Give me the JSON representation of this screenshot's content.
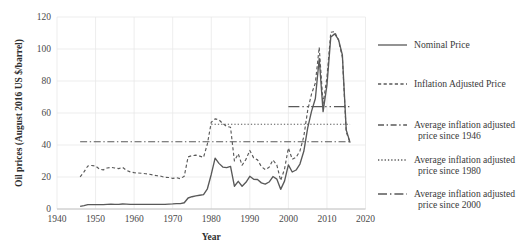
{
  "chart_data": {
    "type": "line",
    "title": "",
    "xlabel": "Year",
    "ylabel": "Oil prices (August 2016 US $/barrel)",
    "xlim": [
      1940,
      2020
    ],
    "ylim": [
      0,
      120
    ],
    "xticks": [
      "1940",
      "1950",
      "1960",
      "1970",
      "1980",
      "1990",
      "2000",
      "2010",
      "2020"
    ],
    "yticks": [
      "0",
      "20",
      "40",
      "60",
      "80",
      "100",
      "120"
    ],
    "grid": true,
    "legend_position": "right",
    "series": [
      {
        "name": "Nominal Price",
        "style": "solid",
        "x": [
          1946,
          1947,
          1948,
          1949,
          1950,
          1951,
          1952,
          1953,
          1954,
          1955,
          1956,
          1957,
          1958,
          1959,
          1960,
          1961,
          1962,
          1963,
          1964,
          1965,
          1966,
          1967,
          1968,
          1969,
          1970,
          1971,
          1972,
          1973,
          1974,
          1975,
          1976,
          1977,
          1978,
          1979,
          1980,
          1981,
          1982,
          1983,
          1984,
          1985,
          1986,
          1987,
          1988,
          1989,
          1990,
          1991,
          1992,
          1993,
          1994,
          1995,
          1996,
          1997,
          1998,
          1999,
          2000,
          2001,
          2002,
          2003,
          2004,
          2005,
          2006,
          2007,
          2008,
          2009,
          2010,
          2011,
          2012,
          2013,
          2014,
          2015,
          2016
        ],
        "values": [
          1.63,
          2.16,
          2.77,
          2.77,
          2.77,
          2.77,
          2.77,
          2.92,
          2.99,
          2.93,
          2.94,
          3.14,
          3.0,
          2.9,
          2.88,
          2.89,
          2.9,
          2.89,
          2.88,
          2.86,
          2.88,
          2.92,
          2.94,
          3.09,
          3.18,
          3.39,
          3.39,
          3.89,
          6.87,
          7.67,
          8.19,
          8.57,
          9.0,
          12.64,
          21.59,
          31.77,
          28.52,
          26.19,
          25.88,
          26.67,
          14.24,
          17.31,
          14.24,
          16.71,
          20.45,
          18.62,
          18.44,
          16.33,
          15.53,
          16.86,
          20.29,
          18.68,
          12.28,
          17.44,
          27.6,
          23.12,
          24.36,
          28.1,
          36.05,
          50.59,
          61.0,
          69.04,
          94.1,
          60.86,
          77.38,
          107.46,
          109.45,
          105.87,
          96.29,
          49.49,
          41.5
        ]
      },
      {
        "name": "Inflation Adjusted Price",
        "style": "dashed",
        "x": [
          1946,
          1947,
          1948,
          1949,
          1950,
          1951,
          1952,
          1953,
          1954,
          1955,
          1956,
          1957,
          1958,
          1959,
          1960,
          1961,
          1962,
          1963,
          1964,
          1965,
          1966,
          1967,
          1968,
          1969,
          1970,
          1971,
          1972,
          1973,
          1974,
          1975,
          1976,
          1977,
          1978,
          1979,
          1980,
          1981,
          1982,
          1983,
          1984,
          1985,
          1986,
          1987,
          1988,
          1989,
          1990,
          1991,
          1992,
          1993,
          1994,
          1995,
          1996,
          1997,
          1998,
          1999,
          2000,
          2001,
          2002,
          2003,
          2004,
          2005,
          2006,
          2007,
          2008,
          2009,
          2010,
          2011,
          2012,
          2013,
          2014,
          2015,
          2016
        ],
        "values": [
          20.05,
          23.2,
          26.9,
          27.2,
          26.85,
          24.95,
          24.45,
          25.6,
          26.05,
          25.6,
          25.25,
          26.05,
          24.2,
          23.2,
          22.7,
          22.5,
          22.35,
          22.05,
          21.7,
          21.2,
          20.8,
          20.45,
          19.75,
          19.7,
          19.15,
          19.55,
          18.95,
          20.5,
          32.6,
          33.35,
          33.65,
          33.05,
          32.3,
          40.7,
          54.2,
          56.35,
          55.75,
          53.35,
          51.65,
          51.1,
          30.05,
          34.5,
          27.35,
          31.05,
          36.6,
          31.95,
          30.7,
          26.5,
          24.6,
          26.05,
          30.65,
          27.55,
          17.8,
          24.9,
          38.15,
          31.1,
          32.25,
          36.3,
          45.3,
          61.55,
          71.85,
          78.8,
          101.05,
          65.65,
          82.15,
          110.45,
          110.85,
          105.45,
          94.85,
          48.15,
          41.55
        ]
      }
    ],
    "reference_lines": [
      {
        "name": "Average inflation adjusted price since 1946",
        "value": 42,
        "x_start": 1946,
        "x_end": 2016,
        "style": "dash-dot"
      },
      {
        "name": "Average inflation adjusted price since 1980",
        "value": 53,
        "x_start": 1980,
        "x_end": 2016,
        "style": "dotted"
      },
      {
        "name": "Average inflation adjusted price since 2000",
        "value": 64,
        "x_start": 2000,
        "x_end": 2016,
        "style": "long-dash-dot-dot"
      }
    ]
  },
  "legend": {
    "items": [
      {
        "label": "Nominal Price",
        "style": "solid"
      },
      {
        "label": "Inflation Adjusted Price",
        "style": "dashed"
      },
      {
        "label_line1": "Average inflation adjusted",
        "label_line2": "price since 1946",
        "style": "dash-dot"
      },
      {
        "label_line1": "Average inflation adjusted",
        "label_line2": "price since 1980",
        "style": "dotted"
      },
      {
        "label_line1": "Average inflation adjusted",
        "label_line2": "price since 2000",
        "style": "long-dash-dot-dot"
      }
    ]
  },
  "colors": {
    "series": "#595959",
    "grid": "#e8e8e8",
    "axis": "#bdbdbd",
    "text": "#3a3a3a",
    "background": "#ffffff"
  }
}
